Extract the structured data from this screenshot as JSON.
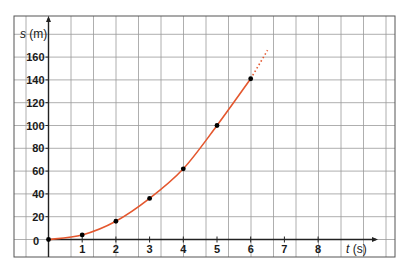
{
  "chart_data": {
    "type": "line",
    "title": "",
    "xlabel": "t (s)",
    "ylabel": "s (m)",
    "xlim": [
      0,
      9
    ],
    "ylim": [
      0,
      170
    ],
    "x_ticks": [
      1,
      2,
      3,
      4,
      5,
      6,
      7,
      8
    ],
    "y_ticks": [
      0,
      20,
      40,
      60,
      80,
      100,
      120,
      140,
      160
    ],
    "origin_label": "0",
    "grid": true,
    "legend": null,
    "series": [
      {
        "name": "s(t)",
        "color": "#e4572e",
        "points": [
          {
            "t": 0,
            "s": 0
          },
          {
            "t": 1,
            "s": 4
          },
          {
            "t": 2,
            "s": 16
          },
          {
            "t": 3,
            "s": 36
          },
          {
            "t": 4,
            "s": 62
          },
          {
            "t": 5,
            "s": 100
          },
          {
            "t": 6,
            "s": 141
          }
        ],
        "extrapolation": {
          "style": "dotted",
          "from": {
            "t": 6,
            "s": 141
          },
          "to": {
            "t": 6.5,
            "s": 166
          }
        }
      }
    ]
  },
  "colors": {
    "curve": "#e4572e",
    "grid": "#9a9a9a",
    "axis": "#222222",
    "points": "#000000"
  }
}
